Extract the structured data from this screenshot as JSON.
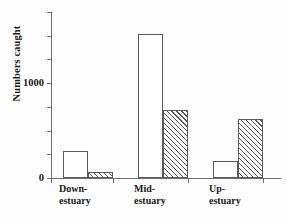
{
  "chart_data": {
    "type": "bar",
    "title": "",
    "xlabel": "",
    "ylabel": "Numbers caught",
    "categories": [
      "Down-estuary",
      "Mid-estuary",
      "Up-estuary"
    ],
    "category_lines": [
      [
        "Down-",
        "estuary"
      ],
      [
        "Mid-",
        "estuary"
      ],
      [
        "Up-",
        "estuary"
      ]
    ],
    "series": [
      {
        "name": "open",
        "fill": "white",
        "values": [
          285,
          1520,
          180
        ]
      },
      {
        "name": "hatched",
        "fill": "diagonal-hatch",
        "values": [
          65,
          715,
          620
        ]
      }
    ],
    "ylim": [
      0,
      1750
    ],
    "yticks": [
      0,
      250,
      500,
      750,
      1000,
      1250,
      1500,
      1750
    ],
    "ytick_labels": [
      "0",
      "",
      "",
      "",
      "1000",
      "",
      "",
      ""
    ],
    "grid": false,
    "legend": "none",
    "axis_color": "#6f6f6f",
    "bar_edge_color": "#5a5a5a",
    "bar_fill_color": "#ffffff",
    "background_color": "#fdfdfd"
  }
}
